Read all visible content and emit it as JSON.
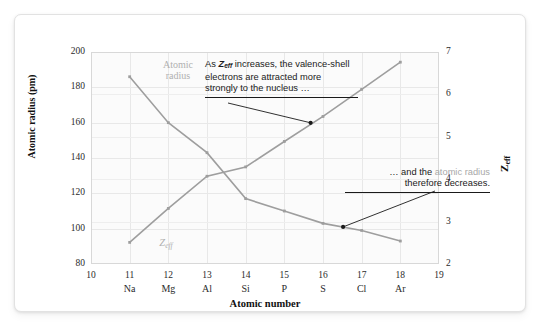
{
  "chart_data": {
    "type": "line",
    "title": "",
    "xlabel": "Atomic number",
    "ylabel": "Atomic radius (pm)",
    "y2label": "Zeff",
    "xlim": [
      10,
      19
    ],
    "ylim": [
      80,
      200
    ],
    "y2lim": [
      2,
      7
    ],
    "grid": true,
    "legend_position": "inline-labels",
    "x": [
      11,
      12,
      13,
      14,
      15,
      16,
      17,
      18
    ],
    "categories": [
      "Na",
      "Mg",
      "Al",
      "Si",
      "P",
      "S",
      "Cl",
      "Ar"
    ],
    "xtick_labels": [
      "10",
      "11",
      "12",
      "13",
      "14",
      "15",
      "16",
      "17",
      "18",
      "19"
    ],
    "ytick_labels": [
      "80",
      "100",
      "120",
      "140",
      "160",
      "180",
      "200"
    ],
    "y2tick_labels": [
      "2",
      "3",
      "4",
      "5",
      "6",
      "7"
    ],
    "series": [
      {
        "name": "Atomic radius",
        "axis": "left",
        "unit": "pm",
        "color": "#9e9e9e",
        "values": [
          186,
          160,
          143,
          117,
          110,
          103,
          99,
          93
        ]
      },
      {
        "name": "Zeff",
        "axis": "right",
        "unit": "",
        "color": "#9e9e9e",
        "values": [
          2.51,
          3.31,
          4.07,
          4.29,
          4.89,
          5.48,
          6.12,
          6.76
        ]
      }
    ],
    "annotations": [
      {
        "id": "annotation-zeff",
        "lines": [
          "As Zeff increases, the valence-shell",
          "electrons are attracted more",
          "strongly to the nucleus …"
        ],
        "line1_pre": "As ",
        "line1_italic": "Z",
        "line1_sub": "eff",
        "line1_post": " increases, the valence-shell",
        "line2": "electrons are attracted more",
        "line3": "strongly to the nucleus …",
        "points_to": "Zeff series"
      },
      {
        "id": "annotation-radius",
        "line1_pre": "… and the ",
        "line1_gray": "atomic radius",
        "line2": "therefore decreases.",
        "points_to": "Atomic radius series"
      }
    ],
    "series_labels": {
      "atomic_radius_line1": "Atomic",
      "atomic_radius_line2": "radius",
      "zeff": "Z",
      "zeff_sub": "eff"
    }
  },
  "colors": {
    "series": "#9e9e9e",
    "grid": "#e8e8e8",
    "plot_background": "#fbfbfb",
    "frame": "#d8d8d8",
    "text": "#1a1a1a",
    "muted_text": "#a8a8a8"
  }
}
